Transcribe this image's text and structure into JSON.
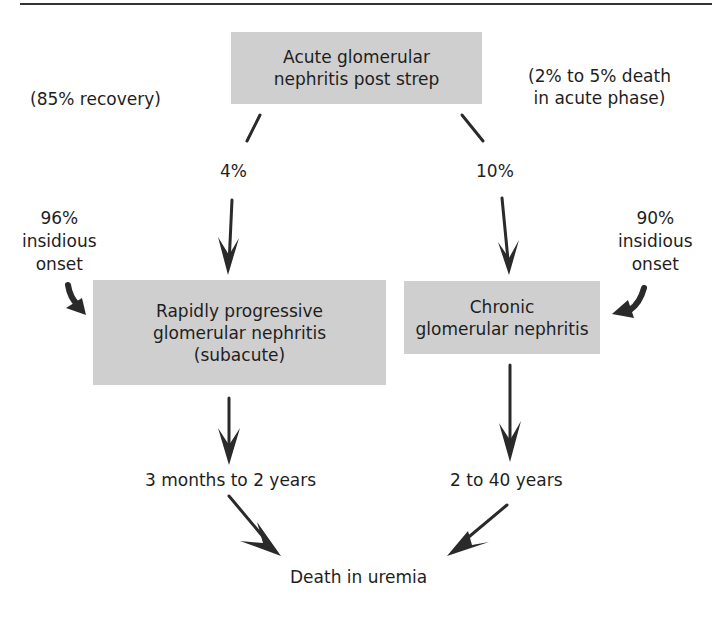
{
  "diagram": {
    "nodes": {
      "acute": {
        "line1": "Acute glomerular",
        "line2": "nephritis post strep"
      },
      "rapid": {
        "line1": "Rapidly progressive",
        "line2": "glomerular nephritis",
        "line3": "(subacute)"
      },
      "chronic": {
        "line1": "Chronic",
        "line2": "glomerular nephritis"
      },
      "death": {
        "label": "Death in uremia"
      }
    },
    "annotations": {
      "recovery": "(85% recovery)",
      "acute_death_line1": "(2% to 5% death",
      "acute_death_line2": "in acute phase)",
      "left_pct": "4%",
      "right_pct": "10%",
      "left_insidious_pct": "96%",
      "left_insidious_l2": "insidious",
      "left_insidious_l3": "onset",
      "right_insidious_pct": "90%",
      "right_insidious_l2": "insidious",
      "right_insidious_l3": "onset",
      "left_duration": "3 months to 2 years",
      "right_duration": "2 to 40 years"
    },
    "colors": {
      "box_fill": "#cfcfcf",
      "arrow": "#2a2a2a",
      "text": "#1e1e1e"
    }
  }
}
